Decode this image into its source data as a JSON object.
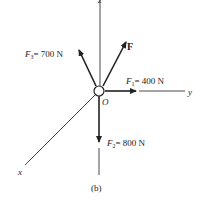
{
  "diagram": {
    "caption": "(b)",
    "origin_label": "O",
    "axes": {
      "z": "z",
      "y": "y",
      "x": "x"
    },
    "forces": [
      {
        "name": "F1",
        "symbol": "F",
        "subscript": "1",
        "value": "= 400 N",
        "direction": "+y"
      },
      {
        "name": "F2",
        "symbol": "F",
        "subscript": "2",
        "value": "= 800 N",
        "direction": "-z"
      },
      {
        "name": "F3",
        "symbol": "F",
        "subscript": "3",
        "value": "= 700 N",
        "direction": "up-left"
      },
      {
        "name": "F",
        "symbol": "F",
        "subscript": "",
        "value": "",
        "direction": "up-right"
      }
    ]
  }
}
